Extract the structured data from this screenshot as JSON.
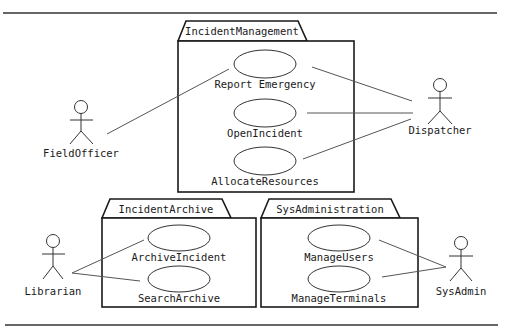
{
  "diagram": {
    "type": "uml-use-case",
    "colors": {
      "line": "#1a1a1a",
      "background": "#ffffff"
    },
    "packages": [
      {
        "id": "im",
        "name": "IncidentManagement"
      },
      {
        "id": "ia",
        "name": "IncidentArchive"
      },
      {
        "id": "sa",
        "name": "SysAdministration"
      }
    ],
    "use_cases": [
      {
        "id": "uc1",
        "package": "im",
        "label": "Report Emergency"
      },
      {
        "id": "uc2",
        "package": "im",
        "label": "OpenIncident"
      },
      {
        "id": "uc3",
        "package": "im",
        "label": "AllocateResources"
      },
      {
        "id": "uc4",
        "package": "ia",
        "label": "ArchiveIncident"
      },
      {
        "id": "uc5",
        "package": "ia",
        "label": "SearchArchive"
      },
      {
        "id": "uc6",
        "package": "sa",
        "label": "ManageUsers"
      },
      {
        "id": "uc7",
        "package": "sa",
        "label": "ManageTerminals"
      }
    ],
    "actors": [
      {
        "id": "a1",
        "label": "FieldOfficer"
      },
      {
        "id": "a2",
        "label": "Dispatcher"
      },
      {
        "id": "a3",
        "label": "Librarian"
      },
      {
        "id": "a4",
        "label": "SysAdmin"
      }
    ],
    "associations": [
      {
        "actor": "FieldOfficer",
        "use_case": "Report Emergency"
      },
      {
        "actor": "Dispatcher",
        "use_case": "Report Emergency"
      },
      {
        "actor": "Dispatcher",
        "use_case": "OpenIncident"
      },
      {
        "actor": "Dispatcher",
        "use_case": "AllocateResources"
      },
      {
        "actor": "Librarian",
        "use_case": "ArchiveIncident"
      },
      {
        "actor": "Librarian",
        "use_case": "SearchArchive"
      },
      {
        "actor": "SysAdmin",
        "use_case": "ManageUsers"
      },
      {
        "actor": "SysAdmin",
        "use_case": "ManageTerminals"
      }
    ]
  }
}
